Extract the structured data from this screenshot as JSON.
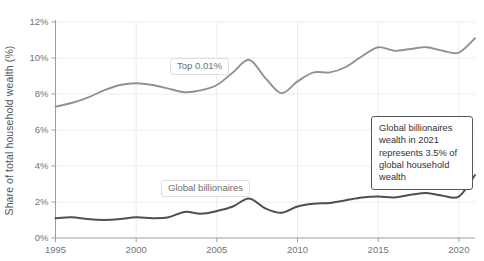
{
  "chart_data": {
    "type": "line",
    "title": "",
    "subtitle": "",
    "xlabel": "",
    "ylabel": "Share of total household wealth (%)",
    "xlim": [
      1995,
      2021
    ],
    "ylim": [
      0,
      12
    ],
    "ytick_labels": [
      "0%",
      "2%",
      "4%",
      "6%",
      "8%",
      "10%",
      "12%"
    ],
    "ytick_values": [
      0,
      2,
      4,
      6,
      8,
      10,
      12
    ],
    "xtick_labels": [
      "1995",
      "2000",
      "2005",
      "2010",
      "2015",
      "2020"
    ],
    "xtick_values": [
      1995,
      2000,
      2005,
      2010,
      2015,
      2020
    ],
    "grid": "both-light",
    "legend_position": "inline-labels",
    "x": [
      1995,
      1996,
      1997,
      1998,
      1999,
      2000,
      2001,
      2002,
      2003,
      2004,
      2005,
      2006,
      2007,
      2008,
      2009,
      2010,
      2011,
      2012,
      2013,
      2014,
      2015,
      2016,
      2017,
      2018,
      2019,
      2020,
      2021
    ],
    "series": [
      {
        "name": "Top 0.01%",
        "color": "#8d9198",
        "values": [
          7.3,
          7.5,
          7.8,
          8.2,
          8.5,
          8.6,
          8.5,
          8.3,
          8.1,
          8.2,
          8.5,
          9.2,
          9.9,
          8.9,
          8.05,
          8.7,
          9.2,
          9.2,
          9.5,
          10.1,
          10.6,
          10.4,
          10.5,
          10.6,
          10.4,
          10.3,
          11.1
        ]
      },
      {
        "name": "Global billionaires",
        "color": "#4b5057",
        "values": [
          1.1,
          1.15,
          1.05,
          1.0,
          1.05,
          1.15,
          1.1,
          1.15,
          1.45,
          1.35,
          1.5,
          1.75,
          2.2,
          1.65,
          1.4,
          1.75,
          1.9,
          1.95,
          2.1,
          2.25,
          2.3,
          2.25,
          2.4,
          2.5,
          2.35,
          2.3,
          3.5
        ]
      }
    ],
    "annotations": [
      {
        "id": "billionaires-2021-callout",
        "text": "Global billionaires wealth in 2021 represents 3.5% of global household wealth"
      }
    ]
  },
  "labels": {
    "top001": "Top 0.01%",
    "billionaires": "Global billionaires"
  },
  "annotation": {
    "text": "Global billionaires wealth in 2021 represents 3.5% of global household wealth"
  },
  "axis": {
    "y_title": "Share of total household wealth (%)"
  }
}
